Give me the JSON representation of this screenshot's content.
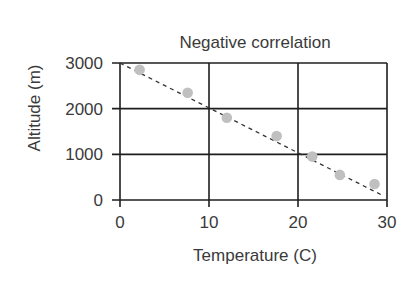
{
  "chart_data": {
    "type": "scatter",
    "title": "Negative correlation",
    "xlabel": "Temperature (C)",
    "ylabel": "Altitude (m)",
    "xlim": [
      0,
      30
    ],
    "ylim": [
      0,
      3000
    ],
    "xticks": [
      0,
      10,
      20,
      30
    ],
    "yticks": [
      0,
      1000,
      2000,
      3000
    ],
    "xtick_labels": [
      "0",
      "10",
      "20",
      "30"
    ],
    "ytick_labels": [
      "0",
      "1000",
      "2000",
      "3000"
    ],
    "grid": true,
    "legend": null,
    "series": [
      {
        "name": "observations",
        "kind": "scatter",
        "color": "#c0c0c0",
        "x": [
          2.2,
          7.6,
          12.0,
          17.6,
          21.6,
          24.7,
          28.6
        ],
        "y": [
          2850,
          2350,
          1800,
          1400,
          950,
          550,
          350
        ]
      },
      {
        "name": "trend line",
        "kind": "line",
        "style": "dashed",
        "color": "#333333",
        "x": [
          0,
          29.5
        ],
        "y": [
          3000,
          100
        ]
      }
    ]
  },
  "colors": {
    "grid": "#1e1e1e",
    "text": "#3a3a3a",
    "point": "#c0c0c0",
    "trend": "#333333"
  }
}
